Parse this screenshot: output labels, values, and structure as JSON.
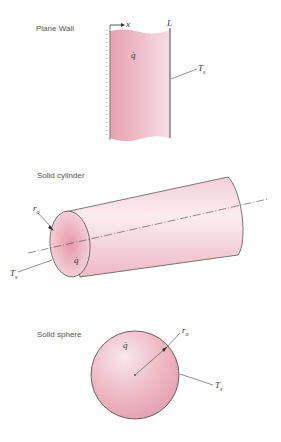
{
  "panels": {
    "plane_wall": {
      "title": "Plane Wall",
      "x_label": "x",
      "L_label": "L",
      "q_label": "q̇",
      "Ts_label": "T",
      "Ts_sub": "s"
    },
    "cylinder": {
      "title": "Solid cylinder",
      "ro_label": "r",
      "ro_sub": "o",
      "q_label": "q̇",
      "Ts_label": "T",
      "Ts_sub": "s"
    },
    "sphere": {
      "title": "Solid sphere",
      "ro_label": "r",
      "ro_sub": "o",
      "q_label": "q̇",
      "Ts_label": "T",
      "Ts_sub": "s"
    }
  },
  "colors": {
    "fill": "#e9a6b4",
    "fill_light": "#f6dde3",
    "outline": "#444444"
  }
}
